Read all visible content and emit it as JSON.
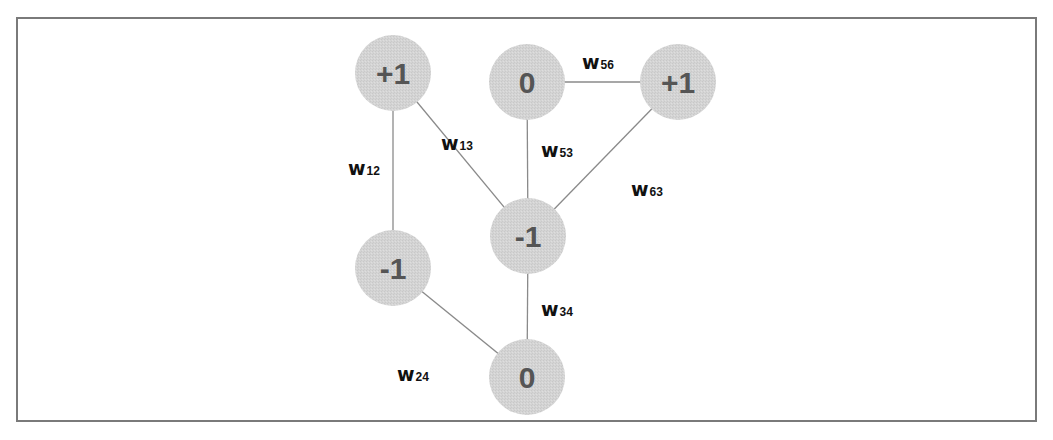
{
  "diagram": {
    "type": "hopfield-network-graph",
    "colors": {
      "node_fill": "#d3d3d3",
      "edge": "#8a8a8a",
      "node_text": "#555555",
      "border": "#7a7a7a"
    },
    "nodes": [
      {
        "id": "1",
        "label": "+1",
        "cx": 393,
        "cy": 73
      },
      {
        "id": "2",
        "label": "-1",
        "cx": 393,
        "cy": 268
      },
      {
        "id": "3",
        "label": "-1",
        "cx": 528,
        "cy": 236
      },
      {
        "id": "4",
        "label": "0",
        "cx": 527,
        "cy": 377
      },
      {
        "id": "5",
        "label": "0",
        "cx": 527,
        "cy": 82
      },
      {
        "id": "6",
        "label": "+1",
        "cx": 678,
        "cy": 82
      }
    ],
    "edges": [
      {
        "from": "1",
        "to": "2",
        "label": "w",
        "sub": "12",
        "lx": 348,
        "ly": 175
      },
      {
        "from": "1",
        "to": "3",
        "label": "w",
        "sub": "13",
        "lx": 441,
        "ly": 150
      },
      {
        "from": "5",
        "to": "3",
        "label": "w",
        "sub": "53",
        "lx": 541,
        "ly": 157
      },
      {
        "from": "5",
        "to": "6",
        "label": "w",
        "sub": "56",
        "lx": 582,
        "ly": 69
      },
      {
        "from": "6",
        "to": "3",
        "label": "w",
        "sub": "63",
        "lx": 631,
        "ly": 196
      },
      {
        "from": "3",
        "to": "4",
        "label": "w",
        "sub": "34",
        "lx": 541,
        "ly": 316
      },
      {
        "from": "2",
        "to": "4",
        "label": "w",
        "sub": "24",
        "lx": 397,
        "ly": 381
      }
    ]
  }
}
